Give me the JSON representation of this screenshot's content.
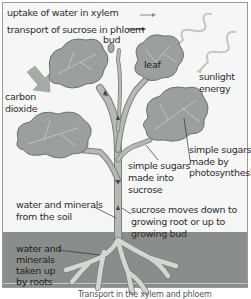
{
  "legend": {
    "xylem_label": "uptake of water in xylem",
    "phloem_label": "transport of sucrose in phloem"
  },
  "labels": {
    "bud": "bud",
    "leaf": "leaf",
    "sunlight_line1": "sunlight",
    "sunlight_line2": "energy",
    "carbon_line1": "carbon",
    "carbon_line2": "dioxide",
    "photosynthesis_line1": "simple sugars",
    "photosynthesis_line2": "made by",
    "photosynthesis_line3": "photosynthesis",
    "sucrose_made_line1": "simple sugars",
    "sucrose_made_line2": "made into",
    "sucrose_made_line3": "sucrose",
    "water_soil_line1": "water and minerals",
    "water_soil_line2": "from the soil",
    "sucrose_moves_line1": "sucrose moves down to",
    "sucrose_moves_line2": "growing root or up to",
    "sucrose_moves_line3": "growing bud",
    "roots_line1": "water and",
    "roots_line2": "minerals",
    "roots_line3": "taken up",
    "roots_line4": "by roots"
  },
  "caption": "Transport in the xylem and phloem",
  "colors": {
    "leaf": "#9d9f9e",
    "leaf_edge": "#6f7170",
    "stem": "#a9aba9",
    "soil": "#8a8d8b",
    "root": "#d4d6d4",
    "background": "#f5f6f5"
  }
}
